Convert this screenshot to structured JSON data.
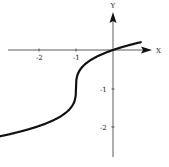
{
  "chart_data": {
    "type": "line",
    "title": "",
    "xlabel": "X",
    "ylabel": "Y",
    "function": "y = cbrt(x + 1) - 1",
    "xlim": [
      -3.05,
      0.75
    ],
    "ylim": [
      -2.27,
      0.2
    ],
    "x_ticks": [
      -2,
      -1
    ],
    "x_tick_labels": [
      "-2",
      "-1"
    ],
    "y_ticks": [
      -1,
      -2
    ],
    "y_tick_labels": [
      "-1",
      "-2"
    ],
    "grid": false,
    "legend": null,
    "series": [
      {
        "name": "curve",
        "x": [
          -3.0,
          -2.5,
          -2.0,
          -1.5,
          -1.2,
          -1.05,
          -1.0,
          -0.95,
          -0.8,
          -0.5,
          0.0,
          0.5,
          0.75
        ],
        "y": [
          -2.26,
          -2.14,
          -2.0,
          -1.79,
          -1.58,
          -1.37,
          -1.0,
          -0.63,
          -0.42,
          -0.21,
          0.0,
          0.14,
          0.21
        ]
      }
    ],
    "notable_points": [
      {
        "x": -1,
        "y": -1,
        "note": "vertical inflection point"
      },
      {
        "x": 0,
        "y": 0,
        "note": "passes through origin"
      },
      {
        "x": -2,
        "y": -2
      }
    ]
  },
  "axes": {
    "x_label": "X",
    "y_label": "Y",
    "x_tick_labels": [
      "-2",
      "-1"
    ],
    "y_tick_labels": [
      "-1",
      "-2"
    ]
  },
  "colors": {
    "curve": "#111111",
    "axis": "#333333",
    "background": "#ffffff"
  }
}
